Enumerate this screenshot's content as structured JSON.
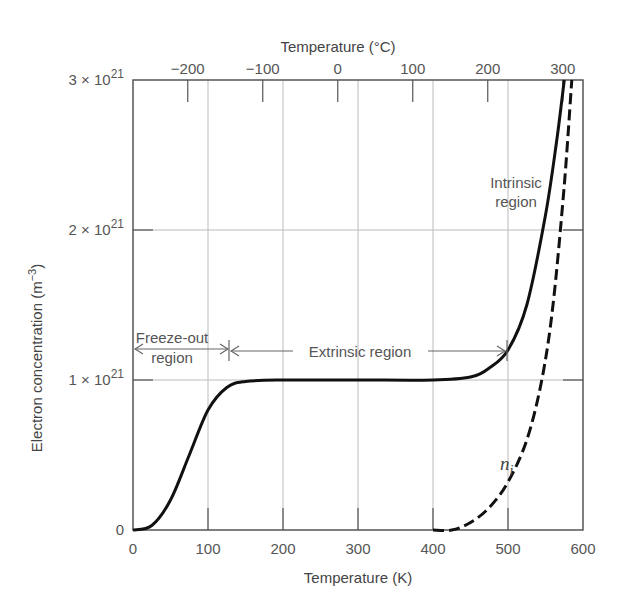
{
  "chart_data": {
    "type": "line",
    "title": "",
    "xlabel": "Temperature (K)",
    "x2label": "Temperature (°C)",
    "ylabel": "Electron concentration (m−3)",
    "xlim": [
      0,
      600
    ],
    "ylim": [
      0,
      3e+21
    ],
    "grid": true,
    "x_ticks": [
      "0",
      "100",
      "200",
      "300",
      "400",
      "500",
      "600"
    ],
    "x2_ticks": [
      "−200",
      "−100",
      "0",
      "100",
      "200",
      "300"
    ],
    "x2_tick_positions_K": [
      73,
      173,
      273,
      373,
      473,
      573
    ],
    "y_ticks": [
      {
        "value": 0,
        "mantissa": "0",
        "exp": ""
      },
      {
        "value": 1e+21,
        "mantissa": "1 × 10",
        "exp": "21"
      },
      {
        "value": 2e+21,
        "mantissa": "2 × 10",
        "exp": "21"
      },
      {
        "value": 3e+21,
        "mantissa": "3 × 10",
        "exp": "21"
      }
    ],
    "series": [
      {
        "name": "Electron concentration",
        "style": "solid",
        "x": [
          0,
          25,
          50,
          75,
          100,
          125,
          150,
          200,
          300,
          400,
          450,
          475,
          500,
          525,
          550,
          565,
          575
        ],
        "y": [
          0,
          3e+19,
          2e+20,
          5e+20,
          8e+20,
          9.5e+20,
          9.9e+20,
          1e+21,
          1e+21,
          1e+21,
          1.02e+21,
          1.08e+21,
          1.2e+21,
          1.5e+21,
          2.1e+21,
          2.6e+21,
          3e+21
        ]
      },
      {
        "name": "n_i",
        "style": "dashed",
        "x": [
          400,
          425,
          450,
          475,
          500,
          525,
          545,
          560,
          575,
          585
        ],
        "y": [
          0,
          0.0,
          5e+19,
          1.5e+20,
          3.2e+20,
          6e+20,
          1e+21,
          1.5e+21,
          2.3e+21,
          3e+21
        ]
      }
    ],
    "annotations": {
      "freeze_out": [
        "Freeze-out",
        "region"
      ],
      "extrinsic": "Extrinsic region",
      "intrinsic": [
        "Intrinsic",
        "region"
      ],
      "ni_label": "n",
      "ni_sub": "i"
    },
    "legend": null
  }
}
